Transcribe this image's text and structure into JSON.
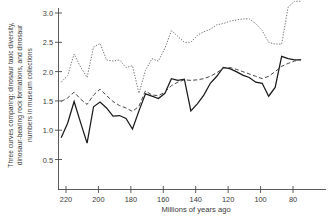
{
  "chart_data": {
    "type": "line",
    "title": "",
    "caption": "Three curves comparing: dinosaur taxic diversity, dinosaur-bearing rock formations, and dinosaur numbers in museum collections",
    "xlabel": "Millions of years ago",
    "ylabel": "Three curves comparing: dinosaur taxic diversity, dinosaur-bearing rock formations, and dinosaur numbers in museum collections",
    "xlim": [
      226,
      72
    ],
    "ylim": [
      0.0,
      3.25
    ],
    "x_reversed": true,
    "grid": false,
    "legend": "none",
    "xticks": [
      220,
      200,
      180,
      160,
      140,
      120,
      100,
      80
    ],
    "xtick_labels": [
      "220",
      "200",
      "180",
      "160",
      "140",
      "120",
      "100",
      "80"
    ],
    "yticks": [
      0.5,
      1.0,
      1.5,
      2.0,
      2.5,
      3.0
    ],
    "ytick_labels": [
      "0.5",
      "1.0",
      "1.5",
      "2.0",
      "2.5",
      "3.0"
    ],
    "series": [
      {
        "name": "dinosaur numbers in museum collections",
        "style": "solid",
        "color": "#1a1a1a",
        "x": [
          223,
          219,
          215,
          211,
          207,
          203,
          199,
          195,
          191,
          187,
          183,
          179,
          175,
          171,
          167,
          163,
          159,
          155,
          151,
          147,
          143,
          139,
          135,
          131,
          127,
          123,
          119,
          115,
          111,
          107,
          103,
          99,
          95,
          91,
          87,
          83,
          79,
          75
        ],
        "y": [
          0.87,
          1.12,
          1.49,
          1.13,
          0.78,
          1.4,
          1.48,
          1.38,
          1.24,
          1.25,
          1.2,
          1.02,
          1.33,
          1.62,
          1.58,
          1.54,
          1.63,
          1.88,
          1.85,
          1.87,
          1.33,
          1.45,
          1.6,
          1.8,
          1.92,
          2.07,
          2.05,
          2.0,
          1.94,
          1.9,
          1.82,
          1.8,
          1.58,
          1.73,
          2.26,
          2.22,
          2.2,
          2.2
        ]
      },
      {
        "name": "dinosaur-bearing rock formations",
        "style": "dashed",
        "color": "#3c3c3c",
        "x": [
          223,
          219,
          215,
          211,
          207,
          203,
          199,
          195,
          191,
          187,
          183,
          179,
          175,
          171,
          167,
          163,
          159,
          155,
          151,
          147,
          143,
          139,
          135,
          131,
          127,
          123,
          119,
          115,
          111,
          107,
          103,
          99,
          95,
          91,
          87,
          83,
          79,
          75
        ],
        "y": [
          1.49,
          1.55,
          1.65,
          1.53,
          1.44,
          1.6,
          1.7,
          1.59,
          1.49,
          1.42,
          1.38,
          1.32,
          1.41,
          1.67,
          1.6,
          1.59,
          1.65,
          1.76,
          1.82,
          1.86,
          1.85,
          1.86,
          1.88,
          1.92,
          1.98,
          2.06,
          2.07,
          2.04,
          2.0,
          1.96,
          1.92,
          1.88,
          1.92,
          2.0,
          2.09,
          2.14,
          2.18,
          2.21
        ]
      },
      {
        "name": "dinosaur taxic diversity",
        "style": "dotted",
        "color": "#6a6a6a",
        "x": [
          223,
          219,
          215,
          211,
          207,
          203,
          199,
          195,
          191,
          187,
          183,
          179,
          175,
          171,
          167,
          163,
          159,
          155,
          151,
          147,
          143,
          139,
          135,
          131,
          127,
          123,
          119,
          115,
          111,
          107,
          103,
          99,
          95,
          91,
          87,
          83,
          79,
          75
        ],
        "y": [
          1.82,
          1.93,
          2.3,
          2.08,
          1.9,
          2.42,
          2.48,
          2.2,
          2.18,
          2.2,
          2.07,
          2.1,
          1.63,
          2.02,
          2.22,
          2.18,
          2.4,
          2.7,
          2.6,
          2.5,
          2.5,
          2.62,
          2.68,
          2.72,
          2.8,
          2.82,
          2.86,
          2.88,
          2.9,
          2.9,
          2.82,
          2.7,
          2.5,
          2.47,
          2.47,
          3.1,
          3.2,
          3.2
        ]
      }
    ]
  },
  "axes": {
    "xlabel": "Millions of years ago",
    "ylabel_line1": "Three curves comparing: dinosaur taxic diversity,",
    "ylabel_line2": "dinosaur-bearing rock formations, and dinosaur",
    "ylabel_line3": "numbers in museum collections"
  }
}
